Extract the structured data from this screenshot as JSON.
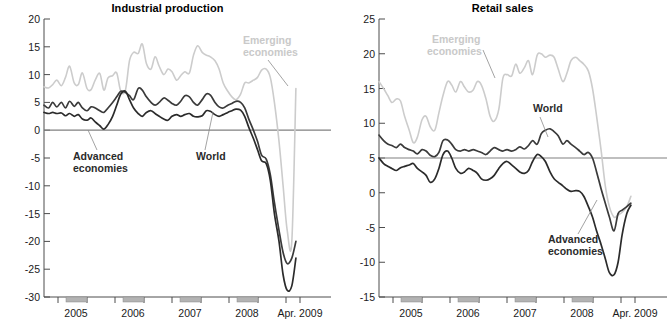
{
  "figure": {
    "panels": [
      {
        "id": "industrial-production",
        "title": "Industrial production",
        "ylim": [
          -30,
          20
        ],
        "yticks": [
          20,
          15,
          10,
          5,
          0,
          -5,
          -10,
          -15,
          -20,
          -25,
          -30
        ],
        "xticks": [
          "2005",
          "2006",
          "2007",
          "2008",
          "Apr. 2009"
        ],
        "annotations": [
          {
            "name": "emerging-economies",
            "text": "Emerging\neconomies",
            "line1": "Emerging",
            "line2": "economies",
            "color": "#cccccc"
          },
          {
            "name": "advanced-economies",
            "text": "Advanced\neconomies",
            "line1": "Advanced",
            "line2": "economies",
            "color": "#2b2b2b"
          },
          {
            "name": "world",
            "text": "World",
            "line1": "World",
            "line2": "",
            "color": "#2b2b2b"
          }
        ]
      },
      {
        "id": "retail-sales",
        "title": "Retail sales",
        "ylim": [
          -15,
          25
        ],
        "yticks": [
          25,
          20,
          15,
          10,
          5,
          0,
          -5,
          -10,
          -15
        ],
        "xticks": [
          "2005",
          "2006",
          "2007",
          "2008",
          "Apr. 2009"
        ],
        "annotations": [
          {
            "name": "emerging-economies",
            "text": "Emerging\neconomies",
            "line1": "Emerging",
            "line2": "economies",
            "color": "#cccccc"
          },
          {
            "name": "world",
            "text": "World",
            "line1": "World",
            "line2": "",
            "color": "#2b2b2b"
          },
          {
            "name": "advanced-economies",
            "text": "Advanced\neconomies",
            "line1": "Advanced",
            "line2": "economies",
            "color": "#2b2b2b"
          }
        ]
      }
    ]
  },
  "colors": {
    "emerging": "#cccccc",
    "world": "#3a3a3a",
    "advanced": "#2b2b2b",
    "axis": "#4d4d4d",
    "zero": "#808080",
    "recession_bar": "#b3b3b3"
  },
  "chart_data": [
    {
      "type": "line",
      "title": "Industrial production",
      "xlabel": "",
      "ylabel": "",
      "ylim": [
        -30,
        20
      ],
      "xlim": [
        2004.33,
        2009.33
      ],
      "grid": false,
      "legend": "inline-annotations",
      "xticklabels": [
        "2005",
        "2006",
        "2007",
        "2008",
        "Apr. 2009"
      ],
      "yticklabels": [
        "20",
        "15",
        "10",
        "5",
        "0",
        "-5",
        "-10",
        "-15",
        "-20",
        "-25",
        "-30"
      ],
      "x": [
        2004.33,
        2004.42,
        2004.5,
        2004.58,
        2004.67,
        2004.75,
        2004.83,
        2004.92,
        2005.0,
        2005.08,
        2005.17,
        2005.25,
        2005.33,
        2005.42,
        2005.5,
        2005.58,
        2005.67,
        2005.75,
        2005.83,
        2005.92,
        2006.0,
        2006.08,
        2006.17,
        2006.25,
        2006.33,
        2006.42,
        2006.5,
        2006.58,
        2006.67,
        2006.75,
        2006.83,
        2006.92,
        2007.0,
        2007.08,
        2007.17,
        2007.25,
        2007.33,
        2007.42,
        2007.5,
        2007.58,
        2007.67,
        2007.75,
        2007.83,
        2007.92,
        2008.0,
        2008.08,
        2008.17,
        2008.25,
        2008.33,
        2008.42,
        2008.5,
        2008.58,
        2008.67,
        2008.75,
        2008.83,
        2008.92,
        2009.0,
        2009.08,
        2009.17,
        2009.25
      ],
      "series": [
        {
          "name": "Emerging economies",
          "color": "#cccccc",
          "values": [
            7.8,
            7.6,
            8.2,
            9.0,
            8.0,
            9.5,
            11.5,
            8.5,
            8.2,
            10.3,
            7.5,
            7.3,
            9.0,
            10.2,
            7.2,
            9.4,
            9.8,
            10.3,
            7.0,
            7.2,
            12.5,
            14.0,
            13.8,
            15.5,
            12.0,
            11.0,
            13.2,
            11.5,
            10.0,
            11.0,
            10.5,
            9.0,
            9.8,
            10.5,
            10.3,
            13.5,
            15.2,
            14.0,
            13.5,
            13.2,
            12.5,
            11.0,
            8.5,
            7.0,
            6.0,
            5.5,
            6.5,
            8.5,
            8.5,
            9.0,
            9.5,
            10.8,
            11.0,
            9.5,
            5.0,
            -2.0,
            -10.0,
            -18.0,
            -20.0,
            7.5
          ]
        },
        {
          "name": "World",
          "color": "#3a3a3a",
          "values": [
            4.5,
            4.0,
            5.0,
            4.2,
            5.0,
            4.0,
            5.2,
            4.3,
            5.0,
            4.0,
            3.5,
            4.2,
            4.0,
            3.5,
            3.2,
            4.0,
            5.0,
            6.0,
            7.0,
            6.8,
            6.2,
            5.5,
            7.5,
            7.2,
            6.0,
            5.0,
            4.5,
            5.0,
            5.8,
            5.4,
            4.8,
            4.5,
            5.2,
            6.2,
            6.0,
            5.0,
            4.5,
            5.5,
            6.5,
            6.3,
            5.0,
            4.2,
            4.0,
            4.5,
            4.8,
            5.2,
            5.0,
            4.0,
            2.0,
            0.0,
            -2.0,
            -4.5,
            -5.2,
            -8.0,
            -13.0,
            -18.0,
            -22.0,
            -24.0,
            -23.0,
            -20.0
          ]
        },
        {
          "name": "Advanced economies",
          "color": "#2b2b2b",
          "values": [
            3.2,
            3.0,
            3.2,
            3.0,
            3.1,
            2.6,
            3.0,
            2.5,
            2.8,
            2.0,
            1.8,
            2.2,
            1.5,
            0.8,
            0.2,
            1.0,
            2.5,
            4.5,
            6.5,
            7.0,
            5.5,
            4.0,
            3.0,
            2.5,
            3.2,
            3.5,
            3.0,
            2.5,
            2.0,
            1.8,
            2.5,
            2.8,
            2.5,
            2.8,
            3.0,
            2.5,
            2.4,
            2.6,
            3.5,
            3.4,
            2.8,
            2.5,
            2.8,
            3.2,
            3.5,
            3.8,
            3.6,
            2.5,
            0.5,
            -1.5,
            -3.5,
            -5.5,
            -6.0,
            -9.0,
            -15.0,
            -20.0,
            -26.0,
            -28.8,
            -28.0,
            -23.0
          ]
        }
      ]
    },
    {
      "type": "line",
      "title": "Retail sales",
      "xlabel": "",
      "ylabel": "",
      "ylim": [
        -15,
        25
      ],
      "xlim": [
        2004.33,
        2009.33
      ],
      "grid": false,
      "legend": "inline-annotations",
      "xticklabels": [
        "2005",
        "2006",
        "2007",
        "2008",
        "Apr. 2009"
      ],
      "yticklabels": [
        "25",
        "20",
        "15",
        "10",
        "5",
        "0",
        "-5",
        "-10",
        "-15"
      ],
      "x": [
        2004.33,
        2004.42,
        2004.5,
        2004.58,
        2004.67,
        2004.75,
        2004.83,
        2004.92,
        2005.0,
        2005.08,
        2005.17,
        2005.25,
        2005.33,
        2005.42,
        2005.5,
        2005.58,
        2005.67,
        2005.75,
        2005.83,
        2005.92,
        2006.0,
        2006.08,
        2006.17,
        2006.25,
        2006.33,
        2006.42,
        2006.5,
        2006.58,
        2006.67,
        2006.75,
        2006.83,
        2006.92,
        2007.0,
        2007.08,
        2007.17,
        2007.25,
        2007.33,
        2007.42,
        2007.5,
        2007.58,
        2007.67,
        2007.75,
        2007.83,
        2007.92,
        2008.0,
        2008.08,
        2008.17,
        2008.25,
        2008.33,
        2008.42,
        2008.5,
        2008.58,
        2008.67,
        2008.75,
        2008.83,
        2008.92,
        2009.0,
        2009.08,
        2009.17,
        2009.25
      ],
      "series": [
        {
          "name": "Emerging economies",
          "color": "#cccccc",
          "values": [
            16.0,
            15.0,
            14.0,
            13.0,
            13.5,
            13.2,
            11.0,
            9.0,
            7.2,
            8.0,
            10.5,
            11.0,
            9.5,
            9.0,
            11.5,
            14.0,
            16.0,
            15.5,
            14.5,
            16.0,
            15.2,
            14.5,
            14.8,
            16.0,
            15.5,
            13.5,
            11.0,
            10.3,
            12.0,
            16.5,
            17.0,
            16.8,
            18.5,
            17.2,
            18.0,
            19.0,
            17.0,
            19.8,
            20.0,
            19.5,
            19.8,
            19.5,
            17.8,
            16.0,
            17.2,
            19.0,
            19.5,
            19.0,
            18.5,
            17.5,
            15.0,
            11.0,
            6.0,
            1.0,
            -2.0,
            -3.5,
            -3.2,
            -2.8,
            -2.0,
            -0.5
          ]
        },
        {
          "name": "World",
          "color": "#3a3a3a",
          "values": [
            8.3,
            7.5,
            7.0,
            6.8,
            6.5,
            7.0,
            6.5,
            6.2,
            6.0,
            5.6,
            6.2,
            6.0,
            5.4,
            5.2,
            5.8,
            7.5,
            7.6,
            7.0,
            6.2,
            6.0,
            6.2,
            6.0,
            6.2,
            6.0,
            5.8,
            5.5,
            6.0,
            6.5,
            6.2,
            6.0,
            6.2,
            6.0,
            6.2,
            6.6,
            6.3,
            6.8,
            7.5,
            7.0,
            8.5,
            9.0,
            9.2,
            8.8,
            8.2,
            7.0,
            7.5,
            7.0,
            6.5,
            6.0,
            5.5,
            5.8,
            5.0,
            3.0,
            0.5,
            -1.5,
            -3.5,
            -5.5,
            -3.0,
            -2.5,
            -2.0,
            -1.5
          ]
        },
        {
          "name": "Advanced economies",
          "color": "#2b2b2b",
          "values": [
            5.0,
            4.2,
            3.8,
            3.5,
            3.2,
            3.6,
            3.8,
            4.0,
            4.2,
            3.5,
            3.0,
            2.5,
            1.5,
            2.0,
            3.5,
            5.5,
            6.0,
            5.0,
            3.5,
            2.8,
            3.0,
            3.5,
            3.2,
            2.8,
            2.0,
            1.8,
            2.0,
            2.5,
            3.5,
            4.2,
            4.5,
            4.0,
            3.5,
            3.0,
            2.8,
            3.2,
            4.5,
            5.5,
            5.2,
            4.5,
            3.0,
            2.0,
            1.5,
            1.0,
            0.5,
            0.2,
            0.3,
            0.2,
            -0.5,
            -2.0,
            -3.5,
            -5.5,
            -7.5,
            -9.5,
            -11.5,
            -11.8,
            -10.0,
            -6.0,
            -3.0,
            -1.8
          ]
        }
      ]
    }
  ]
}
